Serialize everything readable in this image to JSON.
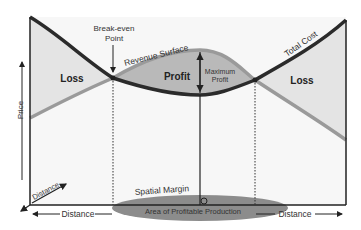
{
  "diagram": {
    "labels": {
      "break_even": [
        "Break-even",
        "Point"
      ],
      "revenue_surface": "Revenue Surface",
      "total_cost": "Total Cost",
      "loss_left": "Loss",
      "loss_right": "Loss",
      "profit": "Profit",
      "maximum_profit": [
        "Maximum",
        "Profit"
      ],
      "price_axis": "Price",
      "distance_diag": "Distance",
      "distance_left": "Distance",
      "distance_right": "Distance",
      "spatial_margin": "Spatial Margin",
      "area_profitable": "Area of Profitable Production",
      "origin_point": "O"
    },
    "colors": {
      "cost_curve": "#2b2b2b",
      "revenue_curve": "#9a9a9a",
      "profit_fill": "#b8b8b8",
      "loss_fill": "#e6e6e6",
      "ellipse_fill": "#8c8c8c",
      "background": "#ffffff"
    }
  }
}
